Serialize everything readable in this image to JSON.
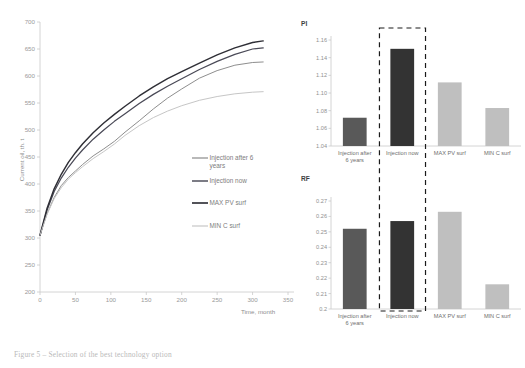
{
  "caption": "Figure 5 – Selection of the best technology option",
  "colors": {
    "axis": "#c9c9c9",
    "tick_text": "#9a9a9a",
    "series_injection_after_6_years": "#808080",
    "series_injection_now": "#4a4a57",
    "series_max_pv_surf": "#2f2f36",
    "series_min_c_surf": "#c6c6c6",
    "bar_injection_after_6_years": "#595959",
    "bar_injection_now": "#333333",
    "bar_max_pv_surf": "#bfbfbf",
    "bar_min_c_surf": "#bfbfbf",
    "highlight_box": "#1a1a1a"
  },
  "line_chart": {
    "type": "line",
    "title": "",
    "xlabel": "Time, month",
    "ylabel": "Current oil, th. t",
    "xlim": [
      0,
      350
    ],
    "ylim": [
      200,
      700
    ],
    "xticks": [
      "0",
      "50",
      "100",
      "150",
      "200",
      "250",
      "300",
      "350"
    ],
    "yticks": [
      "200",
      "250",
      "300",
      "350",
      "400",
      "450",
      "500",
      "550",
      "600",
      "650",
      "700"
    ],
    "grid": false,
    "legend_position": "inside-right",
    "x": [
      0,
      10,
      20,
      30,
      40,
      50,
      60,
      75,
      90,
      105,
      120,
      140,
      160,
      180,
      200,
      225,
      250,
      275,
      300,
      315
    ],
    "series": [
      {
        "name": "Injection after 6 years",
        "color": "#808080",
        "values": [
          305,
          345,
          375,
          397,
          412,
          424,
          436,
          452,
          465,
          479,
          496,
          517,
          539,
          559,
          576,
          596,
          610,
          620,
          625,
          626
        ]
      },
      {
        "name": "Injection now",
        "color": "#4a4a57",
        "values": [
          305,
          352,
          386,
          411,
          431,
          448,
          463,
          483,
          500,
          516,
          530,
          549,
          566,
          581,
          595,
          612,
          627,
          640,
          650,
          652
        ]
      },
      {
        "name": "MAX PV surf",
        "color": "#2f2f36",
        "values": [
          305,
          355,
          391,
          418,
          440,
          458,
          474,
          495,
          513,
          529,
          544,
          563,
          580,
          595,
          608,
          624,
          639,
          652,
          662,
          665
        ]
      },
      {
        "name": "MIN C surf",
        "color": "#c6c6c6",
        "values": [
          305,
          344,
          373,
          393,
          409,
          421,
          432,
          447,
          460,
          474,
          490,
          508,
          523,
          535,
          545,
          555,
          562,
          567,
          570,
          571
        ]
      }
    ]
  },
  "pi_chart": {
    "type": "bar",
    "title": "PI",
    "xlabel": "",
    "ylabel": "",
    "ylim": [
      1.04,
      1.16
    ],
    "yticks": [
      "1.04",
      "1.06",
      "1.08",
      "1.10",
      "1.12",
      "1.14",
      "1.16"
    ],
    "categories": [
      "Injection after 6 years",
      "Injection now",
      "MAX PV surf",
      "MIN C surf"
    ],
    "category_lines": [
      [
        "Injection after",
        "6 years"
      ],
      [
        "Injection now"
      ],
      [
        "MAX PV surf"
      ],
      [
        "MIN C surf"
      ]
    ],
    "values": [
      1.072,
      1.15,
      1.112,
      1.083
    ],
    "bar_colors": [
      "#595959",
      "#333333",
      "#bfbfbf",
      "#bfbfbf"
    ],
    "highlight_index": 1
  },
  "rf_chart": {
    "type": "bar",
    "title": "RF",
    "xlabel": "",
    "ylabel": "",
    "ylim": [
      0.2,
      0.27
    ],
    "yticks": [
      "0.2",
      "0.21",
      "0.22",
      "0.23",
      "0.24",
      "0.25",
      "0.26",
      "0.27"
    ],
    "categories": [
      "Injection after 6 years",
      "Injection now",
      "MAX PV surf",
      "MIN C surf"
    ],
    "category_lines": [
      [
        "Injection after",
        "6 years"
      ],
      [
        "Injection now"
      ],
      [
        "MAX PV surf"
      ],
      [
        "MIN C surf"
      ]
    ],
    "values": [
      0.252,
      0.257,
      0.263,
      0.216
    ],
    "bar_colors": [
      "#595959",
      "#333333",
      "#bfbfbf",
      "#bfbfbf"
    ],
    "highlight_index": 1
  }
}
